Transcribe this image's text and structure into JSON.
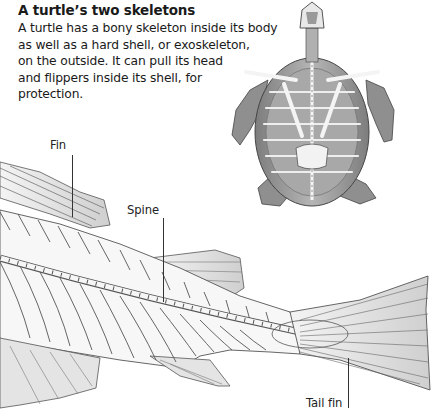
{
  "heading": "A turtle’s two skeletons",
  "body_lines": [
    "A turtle has a bony skeleton inside its body",
    "as well as a hard shell, or exoskeleton,",
    "on the outside. It can pull its head",
    "and flippers inside its shell, for",
    "protection."
  ],
  "illustrations": {
    "turtle": {
      "name": "turtle-skeleton-illustration"
    },
    "fish": {
      "name": "fish-skeleton-illustration"
    }
  },
  "labels": {
    "fin": "Fin",
    "spine": "Spine",
    "tail_fin": "Tail fin"
  },
  "colors": {
    "text": "#1a1a1a",
    "line_art": "#555555",
    "shell_fill": "#9a9a9a",
    "bone_fill": "#f2f2f2"
  }
}
